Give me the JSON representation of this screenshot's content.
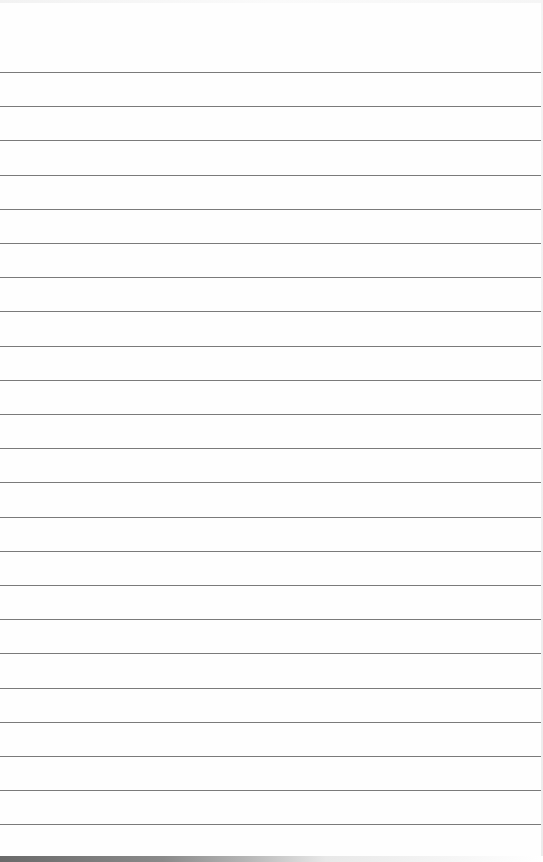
{
  "document": {
    "type": "lined-paper",
    "line_count": 23,
    "first_line_y": 72,
    "line_spacing": 34.2,
    "line_color": "#7a7a7a",
    "background_color": "#fefefe",
    "text_lines": []
  }
}
